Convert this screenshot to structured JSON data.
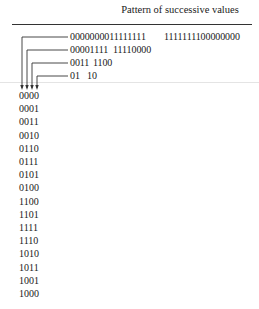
{
  "figure": {
    "header": "Pattern of successive values",
    "bit_patterns": [
      {
        "bit": "MSB",
        "first_half": "0000000011111111",
        "second_half": "1111111100000000"
      },
      {
        "bit": "bit2",
        "first_half": "00001111",
        "second_half": "11110000"
      },
      {
        "bit": "bit1",
        "first_half": "0011",
        "second_half": "1100"
      },
      {
        "bit": "LSB",
        "first_half": "01",
        "second_half": "10"
      }
    ],
    "sequence": [
      "0000",
      "0001",
      "0011",
      "0010",
      "0110",
      "0111",
      "0101",
      "0100",
      "1100",
      "1101",
      "1111",
      "1110",
      "1010",
      "1011",
      "1001",
      "1000"
    ]
  }
}
